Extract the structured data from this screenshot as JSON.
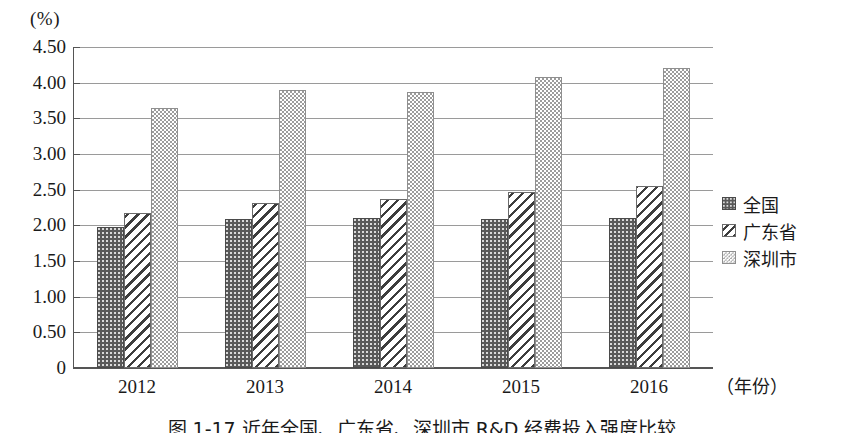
{
  "chart_data": {
    "type": "bar",
    "title": "图 1-17  近年全国、广东省、深圳市 R&D 经费投入强度比较",
    "unit_label": "(%)",
    "xlabel": "（年份）",
    "ylabel": "",
    "categories": [
      "2012",
      "2013",
      "2014",
      "2015",
      "2016"
    ],
    "series": [
      {
        "name": "全国",
        "values": [
          1.98,
          2.09,
          2.1,
          2.09,
          2.1
        ]
      },
      {
        "name": "广东省",
        "values": [
          2.17,
          2.32,
          2.37,
          2.47,
          2.55
        ]
      },
      {
        "name": "深圳市",
        "values": [
          3.65,
          3.9,
          3.87,
          4.08,
          4.21
        ]
      }
    ],
    "ylim": [
      0,
      4.5
    ],
    "ytick_values": [
      4.5,
      4.0,
      3.5,
      3.0,
      2.5,
      2.0,
      1.5,
      1.0,
      0.5,
      0
    ],
    "ytick_labels": [
      "4.50",
      "4.00",
      "3.50",
      "3.00",
      "2.50",
      "2.00",
      "1.50",
      "1.00",
      "0.50",
      "0"
    ],
    "grid": true,
    "legend_position": "right"
  },
  "legend": {
    "items": [
      {
        "label": "全国"
      },
      {
        "label": "广东省"
      },
      {
        "label": "深圳市"
      }
    ]
  },
  "caption": {
    "text": "图 1-17  近年全国、广东省、深圳市 R&D 经费投入强度比较"
  },
  "colors": {
    "axis": "#555555",
    "grid": "#9a9a9a",
    "series_national": "#595959",
    "series_guangdong": "#3d3d3d",
    "series_shenzhen": "#9c9c9c",
    "background": "#ffffff"
  }
}
